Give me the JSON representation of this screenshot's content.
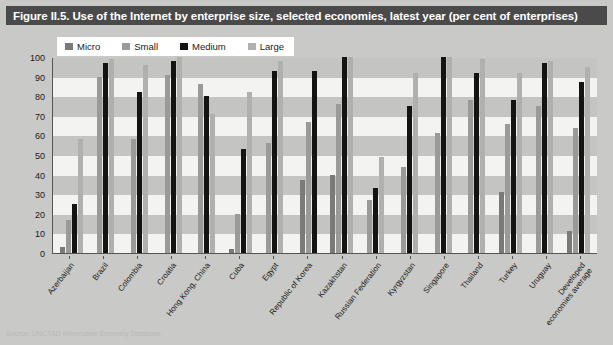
{
  "figure": {
    "title": "Figure II.5. Use of the Internet by enterprise size, selected economies, latest year (per cent of enterprises)",
    "source_note": "Source: UNCTAD Information Economy Database."
  },
  "colors": {
    "micro": "#7a7a78",
    "small": "#9a9a98",
    "medium": "#141414",
    "large": "#b0b0ae",
    "title_band": "#4a4a4a",
    "figure_background": "#c9c9c7",
    "plot_background": "#f3f3f1",
    "band_stripe": "#c4c4c2",
    "axis": "#555555"
  },
  "chart_data": {
    "type": "bar",
    "title": "Figure II.5. Use of the Internet by enterprise size, selected economies, latest year (per cent of enterprises)",
    "xlabel": "",
    "ylabel": "",
    "ylim": [
      0,
      100
    ],
    "yticks": [
      0,
      10,
      20,
      30,
      40,
      50,
      60,
      70,
      80,
      90,
      100
    ],
    "grid": true,
    "legend_position": "top-left",
    "categories": [
      "Azerbaijan",
      "Brazil",
      "Colombia",
      "Croatia",
      "Hong Kong, China",
      "Cuba",
      "Egypt",
      "Republic of Korea",
      "Kazakhstan",
      "Russian Federation",
      "Kyrgyzstan",
      "Singapore",
      "Thailand",
      "Turkey",
      "Uruguay",
      "Developed economies average"
    ],
    "series": [
      {
        "name": "Micro",
        "color": "#7a7a78",
        "values": [
          3,
          null,
          null,
          null,
          null,
          2,
          null,
          37,
          40,
          null,
          null,
          null,
          null,
          31,
          null,
          11
        ]
      },
      {
        "name": "Small",
        "color": "#9a9a98",
        "values": [
          17,
          90,
          58,
          91,
          86,
          20,
          56,
          67,
          76,
          27,
          44,
          61,
          78,
          66,
          75,
          64
        ]
      },
      {
        "name": "Medium",
        "color": "#141414",
        "values": [
          25,
          97,
          82,
          98,
          80,
          53,
          93,
          93,
          100,
          33,
          75,
          100,
          92,
          78,
          97,
          87
        ]
      },
      {
        "name": "Large",
        "color": "#b0b0ae",
        "values": [
          58,
          99,
          96,
          100,
          71,
          82,
          98,
          null,
          100,
          49,
          92,
          100,
          99,
          92,
          98,
          95
        ]
      }
    ]
  }
}
